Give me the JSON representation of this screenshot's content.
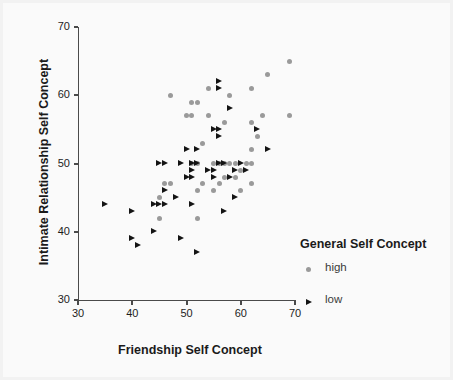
{
  "chart_data": {
    "type": "scatter",
    "title": "",
    "xlabel": "Friendship Self Concept",
    "ylabel": "Intimate Relationship Self Concept",
    "xlim": [
      30,
      70
    ],
    "ylim": [
      30,
      70
    ],
    "xticks": [
      30,
      40,
      50,
      60,
      70
    ],
    "yticks": [
      30,
      40,
      50,
      60,
      70
    ],
    "grid": false,
    "legend": {
      "title": "General Self Concept",
      "position": "right-inside-lower",
      "entries": [
        {
          "label": "high",
          "marker": "circle",
          "color": "#9a9a9a"
        },
        {
          "label": "low",
          "marker": "triangle-right",
          "color": "#141414"
        }
      ]
    },
    "series": [
      {
        "name": "high",
        "marker": "circle",
        "color": "#9a9a9a",
        "points": [
          [
            69,
            65
          ],
          [
            65,
            63
          ],
          [
            62,
            61
          ],
          [
            54,
            61
          ],
          [
            58,
            60
          ],
          [
            47,
            60
          ],
          [
            51,
            59
          ],
          [
            52,
            59
          ],
          [
            50,
            57
          ],
          [
            51,
            57
          ],
          [
            54,
            57
          ],
          [
            64,
            57
          ],
          [
            69,
            57
          ],
          [
            57,
            56
          ],
          [
            62,
            56
          ],
          [
            63,
            54
          ],
          [
            53,
            53
          ],
          [
            62,
            52
          ],
          [
            55,
            50
          ],
          [
            56,
            50
          ],
          [
            57,
            50
          ],
          [
            58,
            50
          ],
          [
            59,
            50
          ],
          [
            61,
            50
          ],
          [
            62,
            50
          ],
          [
            52,
            50
          ],
          [
            51,
            50
          ],
          [
            60,
            49
          ],
          [
            57,
            48
          ],
          [
            59,
            48
          ],
          [
            47,
            47
          ],
          [
            53,
            47
          ],
          [
            56,
            47
          ],
          [
            62,
            47
          ],
          [
            46,
            47
          ],
          [
            60,
            46
          ],
          [
            52,
            46
          ],
          [
            55,
            46
          ],
          [
            45,
            45
          ],
          [
            45,
            42
          ],
          [
            52,
            42
          ]
        ]
      },
      {
        "name": "low",
        "marker": "triangle-right",
        "color": "#141414",
        "points": [
          [
            56,
            62
          ],
          [
            56,
            61
          ],
          [
            58,
            58
          ],
          [
            55,
            55
          ],
          [
            56,
            55
          ],
          [
            56,
            54
          ],
          [
            50,
            52
          ],
          [
            52,
            52
          ],
          [
            65,
            52
          ],
          [
            63,
            55
          ],
          [
            45,
            50
          ],
          [
            46,
            50
          ],
          [
            49,
            50
          ],
          [
            51,
            50
          ],
          [
            52,
            50
          ],
          [
            56,
            50
          ],
          [
            57,
            50
          ],
          [
            60,
            50
          ],
          [
            51,
            49
          ],
          [
            54,
            49
          ],
          [
            55,
            49
          ],
          [
            59,
            49
          ],
          [
            61,
            49
          ],
          [
            50,
            48
          ],
          [
            51,
            48
          ],
          [
            55,
            48
          ],
          [
            58,
            48
          ],
          [
            46,
            46
          ],
          [
            48,
            45
          ],
          [
            59,
            45
          ],
          [
            44,
            44
          ],
          [
            45,
            44
          ],
          [
            46,
            44
          ],
          [
            51,
            44
          ],
          [
            35,
            44
          ],
          [
            57,
            43
          ],
          [
            40,
            43
          ],
          [
            44,
            40
          ],
          [
            40,
            39
          ],
          [
            49,
            39
          ],
          [
            41,
            38
          ],
          [
            52,
            37
          ]
        ]
      }
    ]
  },
  "axes": {
    "x_tick_labels": [
      "30",
      "40",
      "50",
      "60",
      "70"
    ],
    "y_tick_labels": [
      "30",
      "40",
      "50",
      "60",
      "70"
    ]
  }
}
